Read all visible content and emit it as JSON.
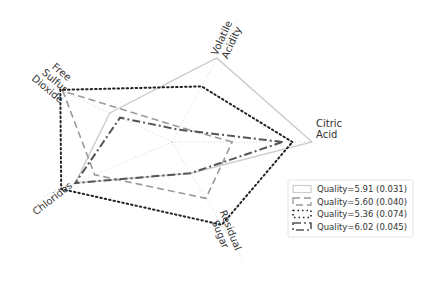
{
  "chart_data": {
    "type": "radar",
    "title": "",
    "axes": [
      {
        "name": "Citric Acid",
        "label_lines": [
          "Citric",
          "Acid"
        ],
        "angle_deg": 0
      },
      {
        "name": "Volatile Acidity",
        "label_lines": [
          "Volatile",
          "Acidity"
        ],
        "angle_deg": 62
      },
      {
        "name": "Free Sulfur Dioxide",
        "label_lines": [
          "Free",
          "Sulfur",
          "Dioxide"
        ],
        "angle_deg": 155
      },
      {
        "name": "Chlorides",
        "label_lines": [
          "Chlorides"
        ],
        "angle_deg": 203
      },
      {
        "name": "Residual Sugar",
        "label_lines": [
          "Residual",
          "Sugar"
        ],
        "angle_deg": 301
      }
    ],
    "range": [
      0,
      1
    ],
    "grid": true,
    "legend_position": "bottom-right",
    "series": [
      {
        "name": "Quality=5.91 (0.031)",
        "style": "solid",
        "color": "#cccccc",
        "values": [
          1.0,
          0.68,
          0.49,
          0.75,
          0.26
        ]
      },
      {
        "name": "Quality=5.60 (0.040)",
        "style": "dashed",
        "color": "#999999",
        "values": [
          0.43,
          0.12,
          0.86,
          0.6,
          0.47
        ]
      },
      {
        "name": "Quality=5.36 (0.074)",
        "style": "dotted",
        "color": "#222222",
        "values": [
          0.86,
          0.45,
          0.88,
          0.86,
          0.69
        ]
      },
      {
        "name": "Quality=6.02 (0.045)",
        "style": "dashdot",
        "color": "#555555",
        "values": [
          0.79,
          0.1,
          0.41,
          0.75,
          0.26
        ]
      }
    ]
  }
}
